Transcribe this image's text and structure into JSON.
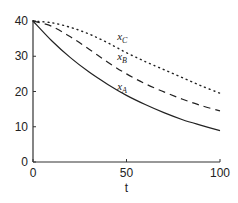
{
  "chart_data": {
    "type": "line",
    "title": "",
    "xlabel": "t",
    "ylabel": "",
    "xlim": [
      0,
      100
    ],
    "ylim": [
      0,
      40
    ],
    "xticks": [
      "0",
      "50",
      "100"
    ],
    "yticks": [
      "0",
      "10",
      "20",
      "30",
      "40"
    ],
    "grid": false,
    "legend": "inline labels",
    "x": [
      0,
      10,
      20,
      30,
      40,
      50,
      60,
      70,
      80,
      90,
      100
    ],
    "series": [
      {
        "name": "x_A",
        "style": "solid",
        "values": [
          40,
          34.4,
          29.6,
          25.5,
          22.0,
          18.9,
          16.3,
          14.0,
          12.0,
          10.4,
          8.9
        ]
      },
      {
        "name": "x_B",
        "style": "dashed",
        "values": [
          40,
          38.5,
          35.5,
          32.0,
          28.3,
          25.0,
          22.2,
          19.9,
          17.8,
          16.0,
          14.5
        ]
      },
      {
        "name": "x_C",
        "style": "dotted",
        "values": [
          40,
          39.5,
          38.2,
          36.3,
          33.8,
          31.0,
          28.5,
          26.2,
          23.9,
          21.6,
          19.5
        ]
      }
    ],
    "annotations": [
      {
        "text": "x_C",
        "t": 45,
        "y": 34.5
      },
      {
        "text": "x_B",
        "t": 45,
        "y": 29
      },
      {
        "text": "x_A",
        "t": 45,
        "y": 20.5
      }
    ]
  },
  "labels": {
    "xlabel": "t",
    "xticks": [
      "0",
      "50",
      "100"
    ],
    "yticks": [
      "0",
      "10",
      "20",
      "30",
      "40"
    ],
    "series_base": [
      "x",
      "x",
      "x"
    ],
    "series_sub": [
      "C",
      "B",
      "A"
    ]
  }
}
